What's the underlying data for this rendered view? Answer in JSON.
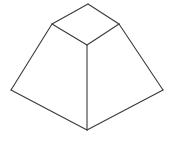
{
  "figure": {
    "type": "line-drawing",
    "projection": "oblique-isometric",
    "canvas": {
      "width": 179,
      "height": 141,
      "background": "#ffffff"
    },
    "style": {
      "stroke_color": "#3a3a3e",
      "stroke_width": 1.1,
      "fill_color": "#ffffff"
    },
    "vertices": {
      "top_back": {
        "x": 88,
        "y": 4
      },
      "top_left": {
        "x": 52,
        "y": 24
      },
      "top_right": {
        "x": 119,
        "y": 24
      },
      "top_front": {
        "x": 87,
        "y": 45
      },
      "base_left": {
        "x": 11,
        "y": 90
      },
      "base_right": {
        "x": 163,
        "y": 90
      },
      "base_front": {
        "x": 87,
        "y": 130
      }
    },
    "faces": [
      {
        "name": "top-face",
        "label": "Top face",
        "points": "88,4 119,24 87,45 52,24"
      },
      {
        "name": "left-front-face",
        "label": "Left front face",
        "points": "52,24 87,45 87,130 11,90"
      },
      {
        "name": "right-front-face",
        "label": "Right front face",
        "points": "119,24 163,90 87,130 87,45"
      }
    ],
    "edges": [
      {
        "name": "top-back-left-edge",
        "label": "Top back-left edge",
        "d": "M 88,4 L 52,24"
      },
      {
        "name": "top-back-right-edge",
        "label": "Top back-right edge",
        "d": "M 88,4 L 119,24"
      },
      {
        "name": "top-front-left-edge",
        "label": "Top front-left edge",
        "d": "M 52,24 L 87,45"
      },
      {
        "name": "top-front-right-edge",
        "label": "Top front-right edge",
        "d": "M 119,24 L 87,45"
      },
      {
        "name": "lateral-left-edge",
        "label": "Left lateral edge",
        "d": "M 52,24 L 11,90"
      },
      {
        "name": "lateral-right-edge",
        "label": "Right lateral edge",
        "d": "M 119,24 L 163,90"
      },
      {
        "name": "lateral-front-edge",
        "label": "Front vertical edge",
        "d": "M 87,45 L 87,130"
      },
      {
        "name": "base-left-edge",
        "label": "Base left edge",
        "d": "M 11,90 L 87,130"
      },
      {
        "name": "base-right-edge",
        "label": "Base right edge",
        "d": "M 163,90 L 87,130"
      }
    ]
  }
}
